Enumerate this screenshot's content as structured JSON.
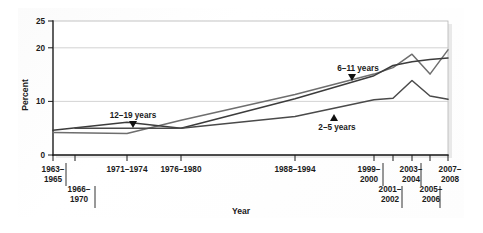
{
  "figure": {
    "background_color": "#ffffff",
    "plot_background_color": "#ffffff"
  },
  "axis": {
    "y_title": "Percent",
    "x_title": "Year"
  },
  "chart_data": {
    "type": "line",
    "title": "",
    "subtitle": "",
    "xlabel": "Year",
    "ylabel": "Percent",
    "ylim": [
      0,
      25
    ],
    "yticks": [
      0,
      10,
      20,
      25
    ],
    "ytick_labels": [
      "0",
      "10",
      "20",
      "25"
    ],
    "grid": true,
    "grid_axis": "y",
    "legend": "inline-annotations",
    "x": [
      "1963-1965",
      "1966-1970",
      "1971-1974",
      "1976-1980",
      "1988-1994",
      "1999-2000",
      "2001-2002",
      "2003-2004",
      "2005-2006",
      "2007-2008"
    ],
    "xtick_labels_row1": [
      "1963–\n1965",
      "",
      "1971–1974",
      "1976–1980",
      "1988–1994",
      "1999–\n2000",
      "",
      "2003–\n2004",
      "",
      "2007–\n2008"
    ],
    "xtick_labels_row2": [
      "",
      "1966–\n1970",
      "",
      "",
      "",
      "",
      "2001–\n2002",
      "",
      "2005–\n2006",
      ""
    ],
    "series": [
      {
        "name": "2-5 years",
        "label": "2–5 years",
        "color": "#4a4a4a",
        "x": [
          "1963-1965",
          "1966-1970",
          "1971-1974",
          "1976-1980",
          "1988-1994",
          "1999-2000",
          "2001-2002",
          "2003-2004",
          "2005-2006",
          "2007-2008"
        ],
        "values": [
          null,
          5.0,
          5.0,
          5.0,
          7.2,
          10.3,
          10.6,
          13.9,
          11.0,
          10.4
        ]
      },
      {
        "name": "6-11 years",
        "label": "6–11 years",
        "color": "#6e6e6e",
        "x": [
          "1963-1965",
          "1966-1970",
          "1971-1974",
          "1976-1980",
          "1988-1994",
          "1999-2000",
          "2001-2002",
          "2003-2004",
          "2005-2006",
          "2007-2008"
        ],
        "values": [
          4.2,
          null,
          4.0,
          6.5,
          11.3,
          15.1,
          16.3,
          18.8,
          15.1,
          19.6
        ]
      },
      {
        "name": "12-19 years",
        "label": "12–19 years",
        "color": "#3c3c3c",
        "x": [
          "1963-1965",
          "1966-1970",
          "1971-1974",
          "1976-1980",
          "1988-1994",
          "1999-2000",
          "2001-2002",
          "2003-2004",
          "2005-2006",
          "2007-2008"
        ],
        "values": [
          4.6,
          null,
          6.1,
          5.0,
          10.5,
          14.8,
          16.7,
          17.4,
          17.8,
          18.1
        ]
      }
    ],
    "annotations": [
      {
        "name": "12-19 years",
        "text": "12–19 years",
        "points_to": "12-19 years series"
      },
      {
        "name": "6-11 years",
        "text": "6–11 years",
        "points_to": "6-11 years series"
      },
      {
        "name": "2-5 years",
        "text": "2–5 years",
        "points_to": "2-5 years series"
      }
    ]
  }
}
